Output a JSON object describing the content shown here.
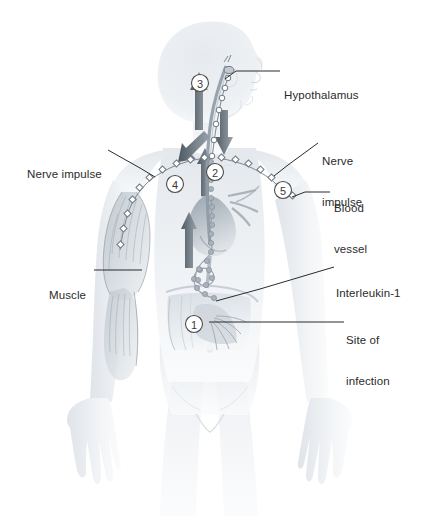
{
  "figure": {
    "width": 424,
    "height": 516,
    "background": "#ffffff",
    "ink_color": "#2b2b2b",
    "body_tint": "#e9ecef",
    "vessel_color": "#8e9aa6",
    "arrow_color": "#5f6a74"
  },
  "labels": [
    {
      "id": "hypothalamus",
      "text": "Hypothalamus",
      "lines": [
        "Hypothalamus"
      ],
      "side": "right",
      "x": 284,
      "y": 65
    },
    {
      "id": "nerve-impulse-r",
      "text": "Nerve impulse",
      "lines": [
        "Nerve",
        "impulse"
      ],
      "side": "right",
      "x": 322,
      "y": 133
    },
    {
      "id": "blood-vessel",
      "text": "Blood vessel",
      "lines": [
        "Blood",
        "vessel"
      ],
      "side": "right",
      "x": 334,
      "y": 180
    },
    {
      "id": "interleukin-1",
      "text": "Interleukin-1",
      "lines": [
        "Interleukin-1"
      ],
      "side": "right",
      "x": 338,
      "y": 263
    },
    {
      "id": "site-of-infection",
      "text": "Site of infection",
      "lines": [
        "Site of",
        "infection"
      ],
      "side": "right",
      "x": 348,
      "y": 312
    },
    {
      "id": "nerve-impulse-l",
      "text": "Nerve impulse",
      "lines": [
        "Nerve impulse"
      ],
      "side": "left",
      "x": 27,
      "y": 144
    },
    {
      "id": "muscle",
      "text": "Muscle",
      "lines": [
        "Muscle"
      ],
      "side": "left",
      "x": 49,
      "y": 264
    }
  ],
  "leaders": [
    {
      "id": "leader-hypothalamus",
      "points": "280,71 236,71 225,79"
    },
    {
      "id": "leader-nerve-impulse-r",
      "points": "318,143 288,165 274,176"
    },
    {
      "id": "leader-blood-vessel",
      "points": "330,192 305,192 292,197"
    },
    {
      "id": "leader-interleukin-1",
      "points": "334,267 260,289 216,301"
    },
    {
      "id": "leader-site-of-infection",
      "points": "344,322 230,322 209,322"
    },
    {
      "id": "leader-nerve-impulse-l",
      "points": "108,150 140,168 155,177"
    },
    {
      "id": "leader-muscle",
      "points": "94,270 134,270 142,270"
    }
  ],
  "markers": [
    {
      "id": "marker-1",
      "number": "1",
      "cx": 194,
      "cy": 324,
      "r": 8.5,
      "meaning": "Site of infection"
    },
    {
      "id": "marker-2",
      "number": "2",
      "cx": 215,
      "cy": 172,
      "r": 8.5,
      "meaning": "Interleukin-1 travels in blood"
    },
    {
      "id": "marker-3",
      "number": "3",
      "cx": 200,
      "cy": 83,
      "r": 8.5,
      "meaning": "Hypothalamus sets higher temperature"
    },
    {
      "id": "marker-4",
      "number": "4",
      "cx": 175,
      "cy": 184,
      "r": 8.5,
      "meaning": "Nerve impulse to muscle"
    },
    {
      "id": "marker-5",
      "number": "5",
      "cx": 283,
      "cy": 190,
      "r": 8.5,
      "meaning": "Nerve impulse to blood vessel"
    }
  ],
  "anatomy": {
    "head": "profile facing right",
    "muscle": "left upper arm striated muscle",
    "heart": "central chest, shaded",
    "abdomen": "site of infection, lower right of torso",
    "interleukin_chain": "beaded chain from abdomen up to heart"
  }
}
